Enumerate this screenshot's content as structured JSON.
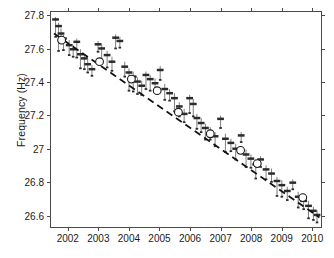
{
  "chart_data": {
    "type": "scatter",
    "title": "",
    "xlabel": "",
    "ylabel": "Frequency (Hz)",
    "xlim": [
      2001.45,
      2010.35
    ],
    "ylim": [
      26.52,
      27.82
    ],
    "grid": false,
    "legend": null,
    "xticks": [
      2002,
      2003,
      2004,
      2005,
      2006,
      2007,
      2008,
      2009,
      2010
    ],
    "xtick_labels": [
      "2002",
      "2003",
      "2004",
      "2005",
      "2006",
      "2007",
      "2008",
      "2009",
      "2010"
    ],
    "yticks": [
      26.6,
      26.8,
      27.0,
      27.2,
      27.4,
      27.6,
      27.8
    ],
    "ytick_labels": [
      "26.6",
      "26.8",
      "27",
      "27.2",
      "27.4",
      "27.6",
      "27.8"
    ],
    "colors": {
      "marker": "#2b2b2b",
      "errorbar": "#6e6e6e",
      "mean_marker_edge": "#1a1a1a",
      "trend_line": "#111111",
      "axis": "#4a4a4a",
      "background": "#ffffff"
    },
    "series": [
      {
        "name": "Individual measurements",
        "marker": "horizontal-dash",
        "errorbars": true,
        "points": [
          {
            "x": 2001.6,
            "y": 27.775,
            "yerr_low": 0.105,
            "yerr_high": 0.015
          },
          {
            "x": 2001.7,
            "y": 27.735,
            "yerr_low": 0.15,
            "yerr_high": 0.02
          },
          {
            "x": 2001.78,
            "y": 27.69,
            "yerr_low": 0.055,
            "yerr_high": 0.03
          },
          {
            "x": 2001.86,
            "y": 27.66,
            "yerr_low": 0.07,
            "yerr_high": 0.025
          },
          {
            "x": 2002.05,
            "y": 27.62,
            "yerr_low": 0.06,
            "yerr_high": 0.03
          },
          {
            "x": 2002.18,
            "y": 27.595,
            "yerr_low": 0.045,
            "yerr_high": 0.025
          },
          {
            "x": 2002.3,
            "y": 27.64,
            "yerr_low": 0.095,
            "yerr_high": 0.02
          },
          {
            "x": 2002.42,
            "y": 27.565,
            "yerr_low": 0.085,
            "yerr_high": 0.03
          },
          {
            "x": 2002.55,
            "y": 27.54,
            "yerr_low": 0.065,
            "yerr_high": 0.025
          },
          {
            "x": 2002.66,
            "y": 27.505,
            "yerr_low": 0.05,
            "yerr_high": 0.03
          },
          {
            "x": 2002.8,
            "y": 27.475,
            "yerr_low": 0.04,
            "yerr_high": 0.025
          },
          {
            "x": 2003.0,
            "y": 27.625,
            "yerr_low": 0.045,
            "yerr_high": 0.02
          },
          {
            "x": 2003.12,
            "y": 27.6,
            "yerr_low": 0.08,
            "yerr_high": 0.03
          },
          {
            "x": 2003.3,
            "y": 27.56,
            "yerr_low": 0.075,
            "yerr_high": 0.025
          },
          {
            "x": 2003.46,
            "y": 27.52,
            "yerr_low": 0.055,
            "yerr_high": 0.03
          },
          {
            "x": 2003.58,
            "y": 27.665,
            "yerr_low": 0.065,
            "yerr_high": 0.02
          },
          {
            "x": 2003.72,
            "y": 27.645,
            "yerr_low": 0.04,
            "yerr_high": 0.025
          },
          {
            "x": 2003.88,
            "y": 27.49,
            "yerr_low": 0.06,
            "yerr_high": 0.03
          },
          {
            "x": 2004.02,
            "y": 27.455,
            "yerr_low": 0.11,
            "yerr_high": 0.025
          },
          {
            "x": 2004.16,
            "y": 27.43,
            "yerr_low": 0.09,
            "yerr_high": 0.03
          },
          {
            "x": 2004.3,
            "y": 27.4,
            "yerr_low": 0.075,
            "yerr_high": 0.025
          },
          {
            "x": 2004.44,
            "y": 27.375,
            "yerr_low": 0.055,
            "yerr_high": 0.03
          },
          {
            "x": 2004.58,
            "y": 27.44,
            "yerr_low": 0.085,
            "yerr_high": 0.02
          },
          {
            "x": 2004.72,
            "y": 27.415,
            "yerr_low": 0.07,
            "yerr_high": 0.025
          },
          {
            "x": 2004.88,
            "y": 27.39,
            "yerr_low": 0.05,
            "yerr_high": 0.03
          },
          {
            "x": 2005.05,
            "y": 27.47,
            "yerr_low": 0.06,
            "yerr_high": 0.025
          },
          {
            "x": 2005.2,
            "y": 27.355,
            "yerr_low": 0.065,
            "yerr_high": 0.03
          },
          {
            "x": 2005.36,
            "y": 27.33,
            "yerr_low": 0.045,
            "yerr_high": 0.025
          },
          {
            "x": 2005.52,
            "y": 27.3,
            "yerr_low": 0.08,
            "yerr_high": 0.03
          },
          {
            "x": 2005.68,
            "y": 27.25,
            "yerr_low": 0.06,
            "yerr_high": 0.025
          },
          {
            "x": 2005.84,
            "y": 27.205,
            "yerr_low": 0.05,
            "yerr_high": 0.03
          },
          {
            "x": 2006.02,
            "y": 27.3,
            "yerr_low": 0.09,
            "yerr_high": 0.02
          },
          {
            "x": 2006.14,
            "y": 27.265,
            "yerr_low": 0.075,
            "yerr_high": 0.03
          },
          {
            "x": 2006.26,
            "y": 27.18,
            "yerr_low": 0.065,
            "yerr_high": 0.025
          },
          {
            "x": 2006.4,
            "y": 27.15,
            "yerr_low": 0.055,
            "yerr_high": 0.03
          },
          {
            "x": 2006.54,
            "y": 27.12,
            "yerr_low": 0.07,
            "yerr_high": 0.025
          },
          {
            "x": 2006.7,
            "y": 27.095,
            "yerr_low": 0.045,
            "yerr_high": 0.03
          },
          {
            "x": 2006.86,
            "y": 27.07,
            "yerr_low": 0.06,
            "yerr_high": 0.025
          },
          {
            "x": 2007.04,
            "y": 27.175,
            "yerr_low": 0.055,
            "yerr_high": 0.02
          },
          {
            "x": 2007.2,
            "y": 27.055,
            "yerr_low": 0.08,
            "yerr_high": 0.03
          },
          {
            "x": 2007.38,
            "y": 27.03,
            "yerr_low": 0.05,
            "yerr_high": 0.025
          },
          {
            "x": 2007.54,
            "y": 26.995,
            "yerr_low": 0.065,
            "yerr_high": 0.03
          },
          {
            "x": 2007.72,
            "y": 27.075,
            "yerr_low": 0.04,
            "yerr_high": 0.02
          },
          {
            "x": 2007.88,
            "y": 26.96,
            "yerr_low": 0.075,
            "yerr_high": 0.03
          },
          {
            "x": 2008.04,
            "y": 26.935,
            "yerr_low": 0.055,
            "yerr_high": 0.025
          },
          {
            "x": 2008.2,
            "y": 26.9,
            "yerr_low": 0.085,
            "yerr_high": 0.03
          },
          {
            "x": 2008.36,
            "y": 26.93,
            "yerr_low": 0.045,
            "yerr_high": 0.02
          },
          {
            "x": 2008.54,
            "y": 26.87,
            "yerr_low": 0.06,
            "yerr_high": 0.025
          },
          {
            "x": 2008.72,
            "y": 26.845,
            "yerr_low": 0.05,
            "yerr_high": 0.03
          },
          {
            "x": 2008.9,
            "y": 26.8,
            "yerr_low": 0.09,
            "yerr_high": 0.025
          },
          {
            "x": 2009.06,
            "y": 26.775,
            "yerr_low": 0.07,
            "yerr_high": 0.03
          },
          {
            "x": 2009.24,
            "y": 26.74,
            "yerr_low": 0.055,
            "yerr_high": 0.025
          },
          {
            "x": 2009.42,
            "y": 26.79,
            "yerr_low": 0.04,
            "yerr_high": 0.02
          },
          {
            "x": 2009.6,
            "y": 26.705,
            "yerr_low": 0.065,
            "yerr_high": 0.03
          },
          {
            "x": 2009.78,
            "y": 26.68,
            "yerr_low": 0.05,
            "yerr_high": 0.025
          },
          {
            "x": 2009.94,
            "y": 26.65,
            "yerr_low": 0.075,
            "yerr_high": 0.03
          },
          {
            "x": 2010.1,
            "y": 26.62,
            "yerr_low": 0.055,
            "yerr_high": 0.025
          },
          {
            "x": 2010.22,
            "y": 26.595,
            "yerr_low": 0.045,
            "yerr_high": 0.03
          }
        ]
      },
      {
        "name": "Annual means",
        "marker": "open-circle",
        "points": [
          {
            "x": 2001.8,
            "y": 27.65
          },
          {
            "x": 2003.05,
            "y": 27.52
          },
          {
            "x": 2004.1,
            "y": 27.415
          },
          {
            "x": 2004.95,
            "y": 27.345
          },
          {
            "x": 2005.65,
            "y": 27.215
          },
          {
            "x": 2006.7,
            "y": 27.085
          },
          {
            "x": 2007.7,
            "y": 26.985
          },
          {
            "x": 2008.25,
            "y": 26.905
          },
          {
            "x": 2009.75,
            "y": 26.7
          }
        ]
      }
    ],
    "trend_line": {
      "style": "dashed",
      "x_start": 2001.55,
      "y_start": 27.69,
      "x_end": 2010.3,
      "y_end": 26.58
    }
  }
}
